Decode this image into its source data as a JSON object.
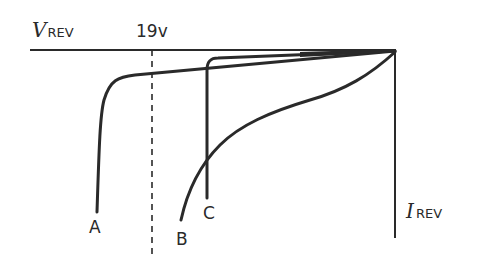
{
  "diagram": {
    "type": "reverse-breakdown characteristics (I-V curves, third quadrant)",
    "axes": {
      "x_label_main": "V",
      "x_label_sub": "REV",
      "y_label_main": "I",
      "y_label_sub": "REV"
    },
    "reference_line": {
      "label": "19v",
      "style": "dashed"
    },
    "curves": [
      {
        "id": "A",
        "label": "A",
        "description": "sharp breakdown beyond 19 V"
      },
      {
        "id": "B",
        "label": "B",
        "description": "soft, gradual breakdown"
      },
      {
        "id": "C",
        "label": "C",
        "description": "sharp breakdown below 19 V"
      }
    ],
    "colors": {
      "line": "#2a2a2a",
      "background": "#ffffff"
    }
  }
}
